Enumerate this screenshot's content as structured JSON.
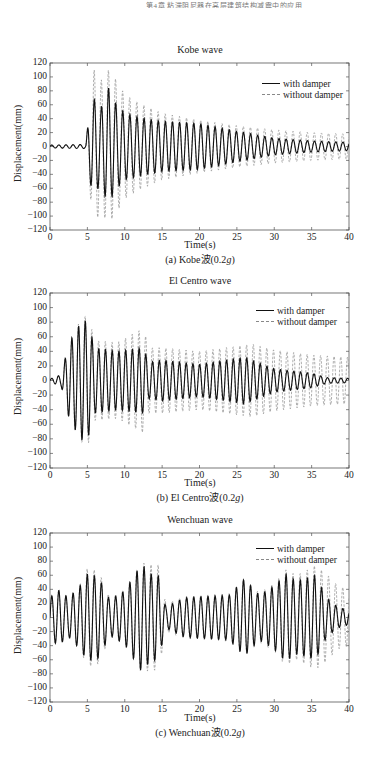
{
  "page": {
    "header_text": "第4章 粘滞阻尼器在高层建筑结构减震中的应用"
  },
  "legend": {
    "series_1": "with damper",
    "series_2": "without damper"
  },
  "axes": {
    "ylabel": "Displacement(mm)",
    "xlabel": "Time(s)",
    "yticks": [
      "120",
      "100",
      "80",
      "60",
      "40",
      "20",
      "0",
      "−20",
      "−40",
      "−60",
      "−80",
      "−100",
      "−120"
    ],
    "xticks": [
      "0",
      "5",
      "10",
      "15",
      "20",
      "25",
      "30",
      "35",
      "40"
    ]
  },
  "panels": [
    {
      "title": "Kobe wave",
      "caption_prefix": "(a) Kobe波(0.2",
      "caption_g": "g",
      "caption_suffix": ")"
    },
    {
      "title": "El Centro wave",
      "caption_prefix": "(b) El Centro波(0.2",
      "caption_g": "g",
      "caption_suffix": ")"
    },
    {
      "title": "Wenchuan wave",
      "caption_prefix": "(c) Wenchuan波(0.2",
      "caption_g": "g",
      "caption_suffix": ")"
    }
  ],
  "chart_data": [
    {
      "type": "line",
      "title": "Kobe wave",
      "caption": "(a) Kobe波(0.2g)",
      "xlabel": "Time(s)",
      "ylabel": "Displacement(mm)",
      "xlim": [
        0,
        40
      ],
      "ylim": [
        -120,
        120
      ],
      "xticks": [
        0,
        5,
        10,
        15,
        20,
        25,
        30,
        35,
        40
      ],
      "yticks": [
        -120,
        -100,
        -80,
        -60,
        -40,
        -20,
        0,
        20,
        40,
        60,
        80,
        100,
        120
      ],
      "grid": false,
      "legend_position": "upper right",
      "period_s": 0.95,
      "series": [
        {
          "name": "with damper",
          "style": "solid black",
          "envelope": {
            "t": [
              0,
              4.8,
              5.2,
              5.8,
              6.8,
              7.8,
              8.6,
              10,
              12,
              15,
              20,
              25,
              30,
              35,
              40
            ],
            "amp": [
              2,
              3,
              45,
              70,
              55,
              85,
              65,
              48,
              42,
              36,
              33,
              22,
              12,
              8,
              6
            ]
          }
        },
        {
          "name": "without damper",
          "style": "dashed gray",
          "envelope": {
            "t": [
              0,
              4.8,
              5.2,
              5.8,
              6.8,
              7.8,
              8.6,
              10,
              12,
              15,
              20,
              25,
              30,
              35,
              40
            ],
            "amp": [
              2,
              3,
              50,
              112,
              95,
              110,
              100,
              75,
              62,
              48,
              38,
              30,
              24,
              20,
              18
            ]
          }
        }
      ]
    },
    {
      "type": "line",
      "title": "El Centro wave",
      "caption": "(b) El Centro波(0.2g)",
      "xlabel": "Time(s)",
      "ylabel": "Displacement(mm)",
      "xlim": [
        0,
        40
      ],
      "ylim": [
        -120,
        120
      ],
      "xticks": [
        0,
        5,
        10,
        15,
        20,
        25,
        30,
        35,
        40
      ],
      "yticks": [
        -120,
        -100,
        -80,
        -60,
        -40,
        -20,
        0,
        20,
        40,
        60,
        80,
        100,
        120
      ],
      "grid": false,
      "legend_position": "upper right",
      "period_s": 0.9,
      "series": [
        {
          "name": "with damper",
          "style": "solid black",
          "envelope": {
            "t": [
              0,
              1.5,
              2.5,
              3.5,
              4.5,
              5.2,
              6,
              9,
              12.5,
              13.2,
              15,
              20,
              26,
              30,
              35,
              37,
              40
            ],
            "amp": [
              2,
              8,
              50,
              70,
              85,
              75,
              45,
              40,
              45,
              25,
              28,
              22,
              32,
              16,
              10,
              4,
              3
            ]
          }
        },
        {
          "name": "without damper",
          "style": "dashed gray",
          "envelope": {
            "t": [
              0,
              1.5,
              2.5,
              3.5,
              4.5,
              5.2,
              6,
              9,
              12.5,
              13.2,
              15,
              20,
              27,
              30,
              35,
              40
            ],
            "amp": [
              2,
              8,
              50,
              72,
              90,
              85,
              55,
              52,
              72,
              45,
              45,
              40,
              50,
              42,
              35,
              32
            ]
          }
        }
      ]
    },
    {
      "type": "line",
      "title": "Wenchuan wave",
      "caption": "(c) Wenchuan波(0.2g)",
      "xlabel": "Time(s)",
      "ylabel": "Displacement(mm)",
      "xlim": [
        0,
        40
      ],
      "ylim": [
        -120,
        120
      ],
      "xticks": [
        0,
        5,
        10,
        15,
        20,
        25,
        30,
        35,
        40
      ],
      "yticks": [
        -120,
        -100,
        -80,
        -60,
        -40,
        -20,
        0,
        20,
        40,
        60,
        80,
        100,
        120
      ],
      "grid": false,
      "legend_position": "upper right",
      "period_s": 0.95,
      "series": [
        {
          "name": "with damper",
          "style": "solid black",
          "envelope": {
            "t": [
              0,
              1,
              2.5,
              4,
              5,
              6.5,
              8,
              10,
              12.2,
              13.5,
              14.5,
              15.5,
              18,
              21,
              24,
              26,
              28,
              30,
              31.5,
              33,
              35.5,
              37,
              38.5,
              40
            ],
            "amp": [
              28,
              40,
              28,
              45,
              62,
              58,
              25,
              38,
              76,
              62,
              60,
              15,
              28,
              30,
              32,
              55,
              32,
              45,
              62,
              52,
              60,
              28,
              15,
              10
            ]
          }
        },
        {
          "name": "without damper",
          "style": "dashed gray",
          "envelope": {
            "t": [
              0,
              1,
              2.5,
              4,
              5,
              6.5,
              8,
              10,
              12.2,
              13.5,
              14.5,
              15.5,
              18,
              21,
              24,
              26,
              28,
              30,
              31.5,
              33,
              35.5,
              37,
              38.5,
              40
            ],
            "amp": [
              28,
              40,
              28,
              45,
              70,
              66,
              28,
              40,
              78,
              75,
              75,
              20,
              30,
              32,
              34,
              55,
              35,
              48,
              68,
              60,
              74,
              62,
              45,
              40
            ]
          }
        }
      ]
    }
  ]
}
